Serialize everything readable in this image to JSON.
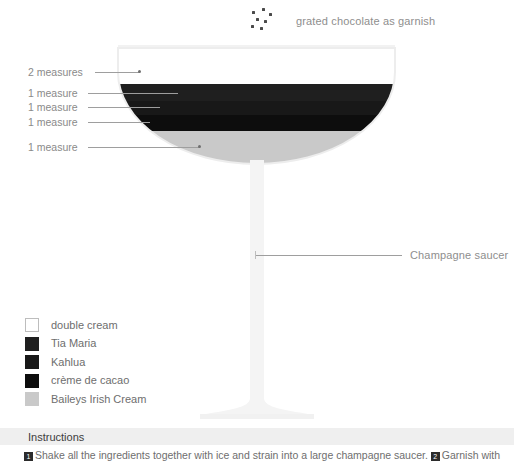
{
  "canvas": {
    "width": 514,
    "height": 463,
    "background": "#ffffff"
  },
  "garnish": {
    "icon": "grated-chocolate-specks",
    "label": "grated chocolate as garnish",
    "dot_color": "#4a4a4a",
    "dots": [
      {
        "x": 2,
        "y": 3
      },
      {
        "x": 12,
        "y": 0
      },
      {
        "x": 19,
        "y": 5
      },
      {
        "x": 6,
        "y": 10
      },
      {
        "x": 14,
        "y": 12
      },
      {
        "x": 1,
        "y": 17
      },
      {
        "x": 10,
        "y": 19
      }
    ]
  },
  "glass": {
    "name": "champagne-saucer",
    "callout_label": "Champagne saucer",
    "rim_color": "#f2f2f2",
    "stem_color": "#f4f4f4",
    "bowl_left": 118,
    "bowl_right": 395,
    "rim_y": 48,
    "bowl_bottom_y": 163
  },
  "measures": [
    {
      "label": "2 measures",
      "y": 72,
      "line_from": 95,
      "line_to": 140,
      "has_dot": true,
      "ingredient": "double cream"
    },
    {
      "label": "1 measure",
      "y": 93,
      "line_from": 88,
      "line_to": 178,
      "has_dot": false,
      "ingredient": "Tia Maria"
    },
    {
      "label": "1 measure",
      "y": 107,
      "line_from": 88,
      "line_to": 160,
      "has_dot": false,
      "ingredient": "Kahlua"
    },
    {
      "label": "1 measure",
      "y": 122,
      "line_from": 88,
      "line_to": 150,
      "has_dot": false,
      "ingredient": "crème de cacao"
    },
    {
      "label": "1 measure",
      "y": 147,
      "line_from": 88,
      "line_to": 200,
      "has_dot": true,
      "ingredient": "Baileys Irish Cream"
    }
  ],
  "layers": [
    {
      "name": "double cream",
      "color": "#ffffff",
      "top": 48,
      "bottom": 84
    },
    {
      "name": "Tia Maria",
      "color": "#1f1f1f",
      "top": 84,
      "bottom": 101
    },
    {
      "name": "Kahlua",
      "color": "#181818",
      "top": 101,
      "bottom": 115
    },
    {
      "name": "crème de cacao",
      "color": "#0d0d0d",
      "top": 115,
      "bottom": 131
    },
    {
      "name": "Baileys Irish Cream",
      "color": "#c9c9c9",
      "top": 131,
      "bottom": 163
    }
  ],
  "legend": {
    "items": [
      {
        "label": "double cream",
        "color": "#ffffff",
        "border": "#bdbdbd"
      },
      {
        "label": "Tia Maria",
        "color": "#1f1f1f",
        "border": "#1f1f1f"
      },
      {
        "label": "Kahlua",
        "color": "#181818",
        "border": "#181818"
      },
      {
        "label": "crème de cacao",
        "color": "#0d0d0d",
        "border": "#0d0d0d"
      },
      {
        "label": "Baileys Irish Cream",
        "color": "#c9c9c9",
        "border": "#c9c9c9"
      }
    ]
  },
  "instructions": {
    "title": "Instructions",
    "step_1_number": "1",
    "step_1_text": "Shake all the ingredients together with ice and strain into a large champagne saucer.",
    "step_2_number": "2",
    "step_2_text": "Garnish with"
  }
}
